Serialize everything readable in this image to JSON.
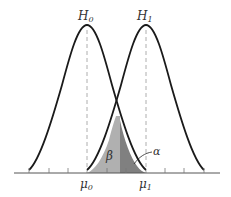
{
  "diagram": {
    "type": "hypothesis-testing-normal-curves",
    "labels": {
      "h0": "H",
      "h0_sub": "0",
      "h1": "H",
      "h1_sub": "1",
      "mu0": "μ",
      "mu0_sub": "0",
      "mu1": "μ",
      "mu1_sub": "1",
      "beta": "β",
      "alpha": "α"
    },
    "colors": {
      "curve": "#1a1a1a",
      "axis": "#555555",
      "dashed": "#999999",
      "beta_fill": "#b0b0b0",
      "alpha_fill": "#808080",
      "label": "#333333"
    }
  }
}
